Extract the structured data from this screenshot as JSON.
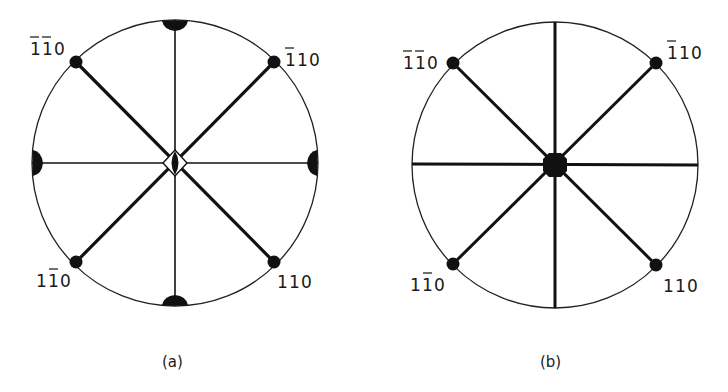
{
  "figure": {
    "panels": [
      {
        "id": "a",
        "caption": "(a)",
        "labels": {
          "top_left": {
            "digits": [
              "1",
              "1",
              "0"
            ],
            "bars": [
              true,
              true,
              false
            ],
            "text": "1̄1̄0"
          },
          "top_right": {
            "digits": [
              "1",
              "1",
              "0"
            ],
            "bars": [
              true,
              false,
              false
            ],
            "text": "1̄10"
          },
          "bottom_left": {
            "digits": [
              "1",
              "1",
              "0"
            ],
            "bars": [
              false,
              true,
              false
            ],
            "text": "11̄0"
          },
          "bottom_right": {
            "digits": [
              "1",
              "1",
              "0"
            ],
            "bars": [
              false,
              false,
              false
            ],
            "text": "110"
          }
        },
        "center_symbol": "diamond-with-lens",
        "edge_symbols": "half-lens at N, S, E, W"
      },
      {
        "id": "b",
        "caption": "(b)",
        "labels": {
          "top_left": {
            "digits": [
              "1",
              "1",
              "0"
            ],
            "bars": [
              true,
              true,
              false
            ],
            "text": "1̄1̄0"
          },
          "top_right": {
            "digits": [
              "1",
              "1",
              "0"
            ],
            "bars": [
              true,
              false,
              false
            ],
            "text": "1̄10"
          },
          "bottom_left": {
            "digits": [
              "1",
              "1",
              "0"
            ],
            "bars": [
              false,
              true,
              false
            ],
            "text": "11̄0"
          },
          "bottom_right": {
            "digits": [
              "1",
              "1",
              "0"
            ],
            "bars": [
              false,
              false,
              false
            ],
            "text": "110"
          }
        },
        "center_symbol": "filled-octagon",
        "edge_symbols": "none"
      }
    ],
    "colors": {
      "ink": "#111111",
      "background": "#ffffff"
    }
  }
}
